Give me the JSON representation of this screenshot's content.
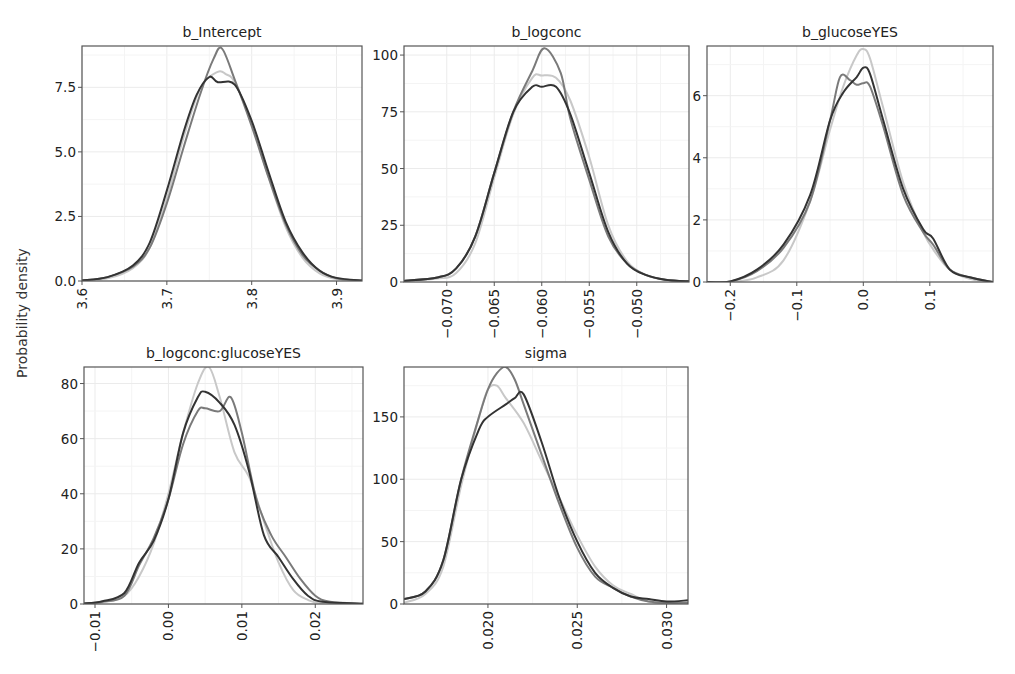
{
  "figure": {
    "ylabel": "Probability density",
    "series_colors": [
      "#333333",
      "#7a7a7a",
      "#c8c8c8"
    ],
    "series_names": [
      "chain 1",
      "chain 2",
      "chain 3"
    ]
  },
  "chart_data": [
    {
      "type": "line",
      "title": "b_Intercept",
      "xlabel": "",
      "ylabel": "Probability density",
      "xlim": [
        3.6,
        3.93
      ],
      "ylim": [
        0,
        9.1
      ],
      "xticks": [
        3.6,
        3.7,
        3.8,
        3.9
      ],
      "xtick_labels": [
        "3.6",
        "3.7",
        "3.8",
        "3.9"
      ],
      "yticks": [
        0,
        2.5,
        5,
        7.5
      ],
      "ytick_labels": [
        "0.0",
        "2.5",
        "5.0",
        "7.5"
      ],
      "grid": true,
      "series": [
        {
          "name": "chain 1",
          "x": [
            3.6,
            3.63,
            3.66,
            3.68,
            3.7,
            3.72,
            3.735,
            3.75,
            3.76,
            3.78,
            3.8,
            3.82,
            3.84,
            3.86,
            3.88,
            3.9,
            3.93
          ],
          "y": [
            0.02,
            0.15,
            0.6,
            1.5,
            3.5,
            5.8,
            7.2,
            7.9,
            7.7,
            7.6,
            6.2,
            4.2,
            2.3,
            1.1,
            0.4,
            0.12,
            0.02
          ]
        },
        {
          "name": "chain 2",
          "x": [
            3.6,
            3.63,
            3.66,
            3.68,
            3.7,
            3.72,
            3.74,
            3.755,
            3.765,
            3.78,
            3.8,
            3.82,
            3.84,
            3.86,
            3.88,
            3.9,
            3.93
          ],
          "y": [
            0.02,
            0.15,
            0.55,
            1.3,
            3.0,
            5.2,
            7.3,
            8.6,
            9.0,
            7.8,
            6.0,
            4.0,
            2.2,
            1.0,
            0.4,
            0.1,
            0.02
          ]
        },
        {
          "name": "chain 3",
          "x": [
            3.6,
            3.63,
            3.66,
            3.68,
            3.7,
            3.72,
            3.74,
            3.76,
            3.77,
            3.78,
            3.8,
            3.82,
            3.84,
            3.86,
            3.88,
            3.9,
            3.93
          ],
          "y": [
            0.02,
            0.1,
            0.5,
            1.3,
            3.2,
            5.6,
            7.5,
            8.1,
            8.0,
            7.7,
            6.1,
            4.0,
            2.1,
            0.9,
            0.3,
            0.08,
            0.02
          ]
        }
      ]
    },
    {
      "type": "line",
      "title": "b_logconc",
      "xlabel": "",
      "ylabel": "Probability density",
      "xlim": [
        -0.0745,
        -0.0445
      ],
      "ylim": [
        0,
        104
      ],
      "xticks": [
        -0.07,
        -0.065,
        -0.06,
        -0.055,
        -0.05
      ],
      "xtick_labels": [
        "−0.070",
        "−0.065",
        "−0.060",
        "−0.055",
        "−0.050"
      ],
      "yticks": [
        0,
        25,
        50,
        75,
        100
      ],
      "ytick_labels": [
        "0",
        "25",
        "50",
        "75",
        "100"
      ],
      "grid": true,
      "series": [
        {
          "name": "chain 1",
          "x": [
            -0.0745,
            -0.071,
            -0.069,
            -0.067,
            -0.065,
            -0.063,
            -0.061,
            -0.06,
            -0.0585,
            -0.057,
            -0.055,
            -0.053,
            -0.051,
            -0.049,
            -0.047,
            -0.0445
          ],
          "y": [
            0.5,
            2,
            6,
            20,
            48,
            75,
            86,
            86,
            86,
            74,
            48,
            22,
            8,
            3,
            1,
            0.3
          ]
        },
        {
          "name": "chain 2",
          "x": [
            -0.0745,
            -0.071,
            -0.069,
            -0.067,
            -0.065,
            -0.063,
            -0.061,
            -0.0597,
            -0.058,
            -0.057,
            -0.055,
            -0.053,
            -0.051,
            -0.049,
            -0.047,
            -0.0445
          ],
          "y": [
            0.5,
            2,
            6,
            20,
            48,
            75,
            93,
            103,
            92,
            72,
            45,
            20,
            8,
            3,
            1,
            0.3
          ]
        },
        {
          "name": "chain 3",
          "x": [
            -0.0745,
            -0.071,
            -0.069,
            -0.067,
            -0.065,
            -0.063,
            -0.061,
            -0.06,
            -0.0585,
            -0.057,
            -0.055,
            -0.053,
            -0.051,
            -0.049,
            -0.047,
            -0.0445
          ],
          "y": [
            0.5,
            1.5,
            4,
            17,
            46,
            74,
            90,
            91,
            90,
            80,
            55,
            25,
            9,
            3,
            1,
            0.3
          ]
        }
      ]
    },
    {
      "type": "line",
      "title": "b_glucoseYES",
      "xlabel": "",
      "ylabel": "Probability density",
      "xlim": [
        -0.235,
        0.195
      ],
      "ylim": [
        0,
        7.6
      ],
      "xticks": [
        -0.2,
        -0.1,
        0.0,
        0.1
      ],
      "xtick_labels": [
        "−0.2",
        "−0.1",
        "0.0",
        "0.1"
      ],
      "yticks": [
        0,
        2,
        4,
        6
      ],
      "ytick_labels": [
        "0",
        "2",
        "4",
        "6"
      ],
      "grid": true,
      "series": [
        {
          "name": "chain 1",
          "x": [
            -0.235,
            -0.2,
            -0.16,
            -0.12,
            -0.08,
            -0.05,
            -0.03,
            -0.01,
            0.0,
            0.01,
            0.03,
            0.06,
            0.09,
            0.105,
            0.13,
            0.16,
            0.195
          ],
          "y": [
            0.0,
            0.02,
            0.4,
            1.2,
            2.8,
            5.2,
            6.1,
            6.6,
            6.9,
            6.7,
            5.2,
            3.0,
            1.7,
            1.4,
            0.4,
            0.15,
            0.0
          ]
        },
        {
          "name": "chain 2",
          "x": [
            -0.235,
            -0.2,
            -0.16,
            -0.12,
            -0.08,
            -0.05,
            -0.035,
            -0.02,
            -0.01,
            0.0,
            0.01,
            0.03,
            0.06,
            0.09,
            0.105,
            0.13,
            0.16,
            0.195
          ],
          "y": [
            0.0,
            0.02,
            0.35,
            1.1,
            2.6,
            5.2,
            6.6,
            6.5,
            6.35,
            6.4,
            6.3,
            5.0,
            2.8,
            1.6,
            1.2,
            0.4,
            0.15,
            0.0
          ]
        },
        {
          "name": "chain 3",
          "x": [
            -0.235,
            -0.2,
            -0.16,
            -0.12,
            -0.08,
            -0.05,
            -0.03,
            -0.01,
            0.0,
            0.01,
            0.03,
            0.06,
            0.09,
            0.11,
            0.13,
            0.16,
            0.195
          ],
          "y": [
            0.0,
            0.0,
            0.15,
            0.7,
            2.6,
            4.9,
            6.3,
            7.3,
            7.5,
            7.2,
            5.6,
            3.2,
            1.6,
            0.9,
            0.4,
            0.1,
            0.0
          ]
        }
      ]
    },
    {
      "type": "line",
      "title": "b_logconc:glucoseYES",
      "xlabel": "",
      "ylabel": "Probability density",
      "xlim": [
        -0.0115,
        0.0265
      ],
      "ylim": [
        0,
        86
      ],
      "xticks": [
        -0.01,
        0.0,
        0.01,
        0.02
      ],
      "xtick_labels": [
        "−0.01",
        "0.00",
        "0.01",
        "0.02"
      ],
      "yticks": [
        0,
        20,
        40,
        60,
        80
      ],
      "ytick_labels": [
        "0",
        "20",
        "40",
        "60",
        "80"
      ],
      "grid": true,
      "series": [
        {
          "name": "chain 1",
          "x": [
            -0.0115,
            -0.009,
            -0.006,
            -0.004,
            -0.002,
            0.0,
            0.002,
            0.004,
            0.005,
            0.007,
            0.009,
            0.011,
            0.013,
            0.015,
            0.017,
            0.019,
            0.021,
            0.0265
          ],
          "y": [
            0.2,
            1,
            4,
            15,
            23,
            38,
            62,
            75,
            77,
            73,
            65,
            48,
            25,
            17,
            9,
            3,
            0.8,
            0.1
          ]
        },
        {
          "name": "chain 2",
          "x": [
            -0.0115,
            -0.009,
            -0.006,
            -0.004,
            -0.002,
            0.0,
            0.002,
            0.004,
            0.005,
            0.007,
            0.0085,
            0.01,
            0.012,
            0.014,
            0.016,
            0.018,
            0.02,
            0.022,
            0.0265
          ],
          "y": [
            0.2,
            0.8,
            3,
            14,
            24,
            38,
            58,
            70,
            71,
            70,
            75,
            62,
            38,
            25,
            17,
            9,
            3,
            0.8,
            0.1
          ]
        },
        {
          "name": "chain 3",
          "x": [
            -0.0115,
            -0.009,
            -0.006,
            -0.004,
            -0.002,
            0.0,
            0.002,
            0.004,
            0.0055,
            0.007,
            0.009,
            0.011,
            0.013,
            0.015,
            0.017,
            0.019,
            0.021,
            0.0265
          ],
          "y": [
            0.1,
            0.5,
            3,
            10,
            22,
            40,
            62,
            80,
            86,
            75,
            55,
            46,
            30,
            15,
            5,
            1.5,
            0.3,
            0.1
          ]
        }
      ]
    },
    {
      "type": "line",
      "title": "sigma",
      "xlabel": "",
      "ylabel": "Probability density",
      "xlim": [
        0.0153,
        0.0312
      ],
      "ylim": [
        0,
        190
      ],
      "xticks": [
        0.02,
        0.025,
        0.03
      ],
      "xtick_labels": [
        "0.020",
        "0.025",
        "0.030"
      ],
      "yticks": [
        0,
        50,
        100,
        150
      ],
      "ytick_labels": [
        "0",
        "50",
        "100",
        "150"
      ],
      "grid": true,
      "series": [
        {
          "name": "chain 1",
          "x": [
            0.0153,
            0.0165,
            0.0175,
            0.0185,
            0.0195,
            0.02,
            0.021,
            0.0215,
            0.022,
            0.023,
            0.024,
            0.025,
            0.026,
            0.027,
            0.028,
            0.029,
            0.03,
            0.0312
          ],
          "y": [
            4,
            10,
            35,
            100,
            140,
            150,
            160,
            165,
            168,
            130,
            85,
            50,
            25,
            13,
            6,
            4,
            2,
            3
          ]
        },
        {
          "name": "chain 2",
          "x": [
            0.0153,
            0.0165,
            0.0175,
            0.0185,
            0.0195,
            0.02,
            0.0205,
            0.021,
            0.0215,
            0.022,
            0.023,
            0.024,
            0.025,
            0.026,
            0.027,
            0.028,
            0.029,
            0.03,
            0.0312
          ],
          "y": [
            4,
            10,
            35,
            100,
            150,
            172,
            185,
            190,
            180,
            160,
            120,
            80,
            45,
            22,
            13,
            6,
            2,
            1,
            1
          ]
        },
        {
          "name": "chain 3",
          "x": [
            0.0153,
            0.0165,
            0.0175,
            0.0185,
            0.0195,
            0.02,
            0.0205,
            0.021,
            0.022,
            0.023,
            0.024,
            0.025,
            0.026,
            0.027,
            0.028,
            0.029,
            0.03,
            0.0312
          ],
          "y": [
            1,
            8,
            30,
            95,
            150,
            172,
            175,
            165,
            145,
            115,
            85,
            55,
            30,
            15,
            8,
            2,
            0.5,
            0
          ]
        }
      ]
    }
  ]
}
